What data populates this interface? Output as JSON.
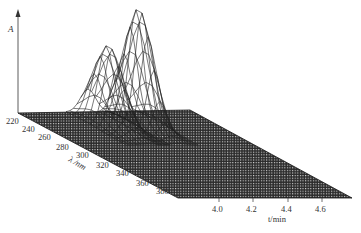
{
  "chart_data": {
    "type": "surface3d",
    "title": "",
    "z_axis_label": "A",
    "wavelength_axis_label": "λ /nm",
    "time_axis_label": "t/min",
    "wavelength_ticks": [
      "220",
      "240",
      "260",
      "280",
      "300",
      "320",
      "340",
      "360",
      "380"
    ],
    "time_ticks": [
      "4.0",
      "4.2",
      "4.4",
      "4.6"
    ],
    "wavelength_range": [
      210,
      390
    ],
    "time_range": [
      3.5,
      4.8
    ],
    "peaks": [
      {
        "name": "peak-1",
        "retention_time_min": 3.72,
        "lambda_max_nm": 250,
        "relative_height": 0.62
      },
      {
        "name": "peak-2",
        "retention_time_min": 3.92,
        "lambda_max_nm": 245,
        "relative_height": 1.0
      }
    ],
    "grid": true,
    "legend": "none"
  },
  "colors": {
    "line": "#222222",
    "mesh": "#333333",
    "background": "#ffffff"
  }
}
